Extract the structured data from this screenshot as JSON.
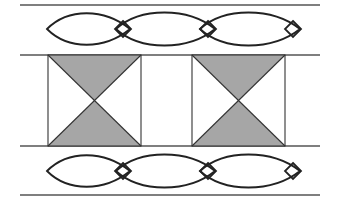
{
  "diagram": {
    "title": "",
    "colors": {
      "stroke": "#222222",
      "fill_shaded": "#a6a6a6",
      "background": "#ffffff"
    },
    "horizontal_lines_y": [
      5,
      55,
      146,
      195
    ],
    "line_x_range": [
      20,
      320
    ],
    "bands": [
      {
        "type": "lens-chain",
        "center_y": 29,
        "lenses": 3,
        "diamonds": 3
      },
      {
        "type": "hourglass-squares",
        "squares": [
          {
            "x": 48,
            "w": 93
          },
          {
            "x": 192,
            "w": 93
          }
        ]
      },
      {
        "type": "lens-chain",
        "center_y": 171,
        "lenses": 3,
        "diamonds": 3
      }
    ]
  }
}
